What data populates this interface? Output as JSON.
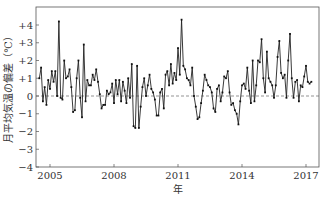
{
  "chart_data": {
    "type": "line",
    "title": "",
    "xlabel": "年",
    "ylabel": "月平均気温の偏差（℃）",
    "ylim": [
      -4,
      4.5
    ],
    "xlim": [
      2004.5,
      2017.55
    ],
    "yticks": [
      {
        "value": 4,
        "label": "+4"
      },
      {
        "value": 3,
        "label": "+3"
      },
      {
        "value": 2,
        "label": "+2"
      },
      {
        "value": 1,
        "label": "+1"
      },
      {
        "value": 0,
        "label": "0"
      },
      {
        "value": -1,
        "label": "−1"
      },
      {
        "value": -2,
        "label": "−2"
      },
      {
        "value": -3,
        "label": "−3"
      },
      {
        "value": -4,
        "label": "−4"
      }
    ],
    "xticks": [
      {
        "value": 2005,
        "label": "2005"
      },
      {
        "value": 2008,
        "label": "2008"
      },
      {
        "value": 2011,
        "label": "2011"
      },
      {
        "value": 2014,
        "label": "2014"
      },
      {
        "value": 2017,
        "label": "2017"
      }
    ],
    "reference_line": {
      "y": 0,
      "style": "dashed"
    },
    "grid": false,
    "x_start": 2004.5,
    "x_step_months": 1,
    "series": [
      {
        "name": "月平均気温の偏差",
        "values": [
          1.0,
          1.6,
          -0.3,
          0.5,
          -0.5,
          0.9,
          0.4,
          1.4,
          0.8,
          1.4,
          0.0,
          4.2,
          -0.1,
          -0.2,
          2.0,
          1.0,
          1.1,
          1.5,
          0.5,
          -0.9,
          -0.8,
          1.0,
          2.0,
          -0.1,
          -1.2,
          2.9,
          -0.3,
          0.9,
          0.6,
          0.6,
          1.2,
          0.9,
          1.5,
          0.8,
          0.1,
          -0.7,
          -0.5,
          -0.5,
          0.3,
          0.1,
          0.2,
          0.7,
          -0.4,
          0.9,
          0.1,
          0.9,
          -0.3,
          0.8,
          0.3,
          -0.4,
          1.0,
          -0.1,
          1.8,
          -1.7,
          -1.8,
          1.7,
          -1.8,
          -0.6,
          0.5,
          1.0,
          0.0,
          0.6,
          1.2,
          0.4,
          0.2,
          -0.2,
          -1.1,
          -1.1,
          0.2,
          0.4,
          -0.7,
          1.2,
          1.4,
          0.6,
          1.8,
          0.7,
          1.3,
          0.9,
          2.7,
          1.2,
          4.3,
          1.7,
          1.5,
          1.0,
          0.9,
          0.6,
          1.6,
          0.0,
          -0.6,
          -1.3,
          -1.2,
          -0.4,
          0.3,
          1.2,
          0.9,
          0.6,
          0.5,
          0.2,
          -0.7,
          -0.9,
          0.4,
          0.6,
          -0.3,
          0.2,
          1.1,
          1.0,
          1.4,
          0.2,
          -0.5,
          -0.4,
          -0.8,
          -1.0,
          -1.6,
          -0.3,
          0.6,
          0.7,
          0.4,
          1.6,
          0.3,
          -0.4,
          2.0,
          -0.3,
          0.6,
          2.0,
          1.9,
          3.2,
          1.0,
          0.2,
          2.5,
          1.0,
          0.8,
          0.6,
          -0.1,
          0.6,
          2.2,
          3.1,
          1.3,
          1.0,
          1.2,
          -0.1,
          2.0,
          3.5,
          1.0,
          -0.1,
          0.8,
          0.9,
          -0.3,
          0.6,
          0.5,
          1.1,
          1.7,
          0.8,
          0.7,
          0.8
        ]
      }
    ]
  }
}
